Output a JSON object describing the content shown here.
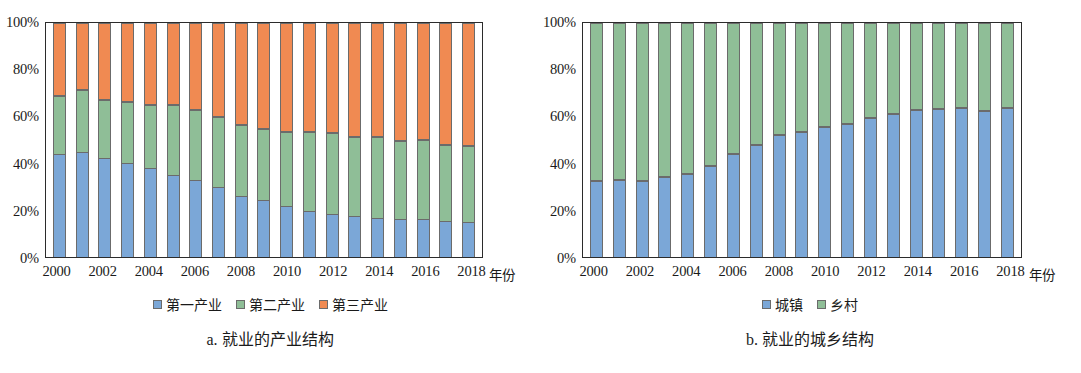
{
  "chart_data": [
    {
      "panel": "a",
      "type": "bar",
      "stacked": true,
      "title": "a. 就业的产业结构",
      "xlabel": "年份",
      "ylabel": "",
      "ylim": [
        0,
        100
      ],
      "y_ticks": [
        "0%",
        "20%",
        "40%",
        "60%",
        "80%",
        "100%"
      ],
      "y_tick_values": [
        0,
        20,
        40,
        60,
        80,
        100
      ],
      "grid": false,
      "legend_position": "bottom",
      "categories": [
        2000,
        2001,
        2002,
        2003,
        2004,
        2005,
        2006,
        2007,
        2008,
        2009,
        2010,
        2011,
        2012,
        2013,
        2014,
        2015,
        2016,
        2017,
        2018
      ],
      "x_tick_labels": [
        "2000",
        "2002",
        "2004",
        "2006",
        "2008",
        "2010",
        "2012",
        "2014",
        "2016",
        "2018"
      ],
      "series": [
        {
          "name": "第一产业",
          "color": "#7BA7D7",
          "values": [
            44.0,
            45.0,
            42.2,
            40.0,
            38.0,
            35.0,
            33.0,
            29.8,
            26.0,
            24.5,
            22.0,
            19.5,
            18.4,
            17.4,
            16.5,
            16.2,
            16.2,
            15.5,
            15.0
          ]
        },
        {
          "name": "第二产业",
          "color": "#8FBE97",
          "values": [
            25.0,
            26.5,
            25.0,
            26.3,
            27.0,
            30.0,
            30.0,
            30.0,
            30.5,
            30.0,
            31.5,
            33.8,
            34.6,
            34.1,
            34.8,
            33.4,
            33.6,
            32.5,
            32.5
          ]
        },
        {
          "name": "第三产业",
          "color": "#F08A52",
          "values": [
            31.0,
            28.5,
            32.8,
            33.7,
            35.0,
            35.0,
            37.0,
            40.2,
            43.5,
            45.5,
            46.5,
            46.7,
            47.0,
            48.5,
            48.7,
            50.4,
            50.2,
            52.0,
            52.5
          ]
        }
      ],
      "stack_tops": {
        "series1_top": [
          44.0,
          45.0,
          42.2,
          40.0,
          38.0,
          35.0,
          33.0,
          29.8,
          26.0,
          24.5,
          22.0,
          19.5,
          18.4,
          17.4,
          16.5,
          16.2,
          16.2,
          15.5,
          15.0
        ],
        "series2_top": [
          69.0,
          71.5,
          67.2,
          66.3,
          65.0,
          65.0,
          63.0,
          59.8,
          56.5,
          54.5,
          53.5,
          53.3,
          53.0,
          51.5,
          51.3,
          49.6,
          49.8,
          48.0,
          47.5
        ]
      }
    },
    {
      "panel": "b",
      "type": "bar",
      "stacked": true,
      "title": "b. 就业的城乡结构",
      "xlabel": "年份",
      "ylabel": "",
      "ylim": [
        0,
        100
      ],
      "y_ticks": [
        "0%",
        "20%",
        "40%",
        "60%",
        "80%",
        "100%"
      ],
      "y_tick_values": [
        0,
        20,
        40,
        60,
        80,
        100
      ],
      "grid": false,
      "legend_position": "bottom",
      "categories": [
        2000,
        2001,
        2002,
        2003,
        2004,
        2005,
        2006,
        2007,
        2008,
        2009,
        2010,
        2011,
        2012,
        2013,
        2014,
        2015,
        2016,
        2017,
        2018
      ],
      "x_tick_labels": [
        "2000",
        "2002",
        "2004",
        "2006",
        "2008",
        "2010",
        "2012",
        "2014",
        "2016",
        "2018"
      ],
      "series": [
        {
          "name": "城镇",
          "color": "#7BA7D7",
          "values": [
            32.5,
            32.7,
            32.5,
            34.2,
            35.5,
            39.0,
            44.0,
            48.0,
            52.0,
            53.5,
            55.5,
            57.0,
            59.5,
            61.0,
            62.8,
            63.2,
            63.8,
            62.5,
            63.6
          ]
        },
        {
          "name": "乡村",
          "color": "#8FBE97",
          "values": [
            67.5,
            67.3,
            67.5,
            65.8,
            64.5,
            61.0,
            56.0,
            52.0,
            48.0,
            46.5,
            44.5,
            43.0,
            40.5,
            39.0,
            37.2,
            36.8,
            36.2,
            37.5,
            36.4
          ]
        }
      ],
      "stack_tops": {
        "series1_top": [
          32.5,
          32.7,
          32.5,
          34.2,
          35.5,
          39.0,
          44.0,
          48.0,
          52.0,
          53.5,
          55.5,
          57.0,
          59.5,
          61.0,
          62.8,
          63.2,
          63.8,
          62.5,
          63.6
        ]
      }
    }
  ],
  "panel_a": {
    "caption": "a. 就业的产业结构",
    "x_axis_title": "年份",
    "y_ticks": [
      "100%",
      "80%",
      "60%",
      "40%",
      "20%",
      "0%"
    ],
    "x_tick_labels": [
      "2000",
      "2002",
      "2004",
      "2006",
      "2008",
      "2010",
      "2012",
      "2014",
      "2016",
      "2018"
    ],
    "legend": [
      {
        "label": "第一产业",
        "color": "#7BA7D7"
      },
      {
        "label": "第二产业",
        "color": "#8FBE97"
      },
      {
        "label": "第三产业",
        "color": "#F08A52"
      }
    ]
  },
  "panel_b": {
    "caption": "b. 就业的城乡结构",
    "x_axis_title": "年份",
    "y_ticks": [
      "100%",
      "80%",
      "60%",
      "40%",
      "20%",
      "0%"
    ],
    "x_tick_labels": [
      "2000",
      "2002",
      "2004",
      "2006",
      "2008",
      "2010",
      "2012",
      "2014",
      "2016",
      "2018"
    ],
    "legend": [
      {
        "label": "城镇",
        "color": "#7BA7D7"
      },
      {
        "label": "乡村",
        "color": "#8FBE97"
      }
    ]
  }
}
